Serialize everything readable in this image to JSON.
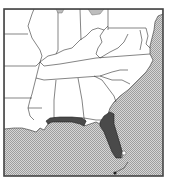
{
  "map": {
    "type": "species-range-map",
    "region": "Southeastern United States",
    "colors": {
      "land": "#ffffff",
      "water": "#c8c8c8",
      "range": "#4a4a4a",
      "border": "#333333"
    },
    "legend": [],
    "range_areas": [
      {
        "name": "Gulf coast panhandle (AL/MS/FL)"
      },
      {
        "name": "Peninsular Florida"
      }
    ],
    "states_shown": [
      "Illinois",
      "Indiana",
      "Ohio",
      "Pennsylvania",
      "Maryland",
      "Delaware",
      "New Jersey",
      "West Virginia",
      "Virginia",
      "Kentucky",
      "Tennessee",
      "North Carolina",
      "South Carolina",
      "Georgia",
      "Alabama",
      "Mississippi",
      "Louisiana",
      "Arkansas",
      "Missouri",
      "Florida"
    ]
  }
}
